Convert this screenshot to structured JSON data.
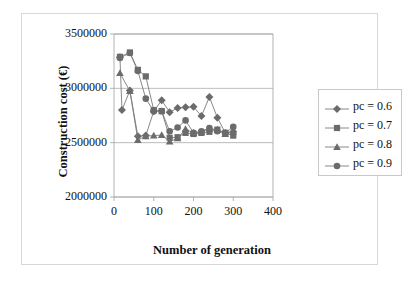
{
  "chart_data": {
    "type": "line",
    "title": "",
    "xlabel": "Number of generation",
    "ylabel": "Construction cost (€)",
    "xlim": [
      0,
      400
    ],
    "ylim": [
      2000000,
      3500000
    ],
    "xticks": [
      0,
      100,
      200,
      300,
      400
    ],
    "yticks": [
      2000000,
      2500000,
      3000000,
      3500000
    ],
    "xtick_labels": [
      "0",
      "100",
      "200",
      "300",
      "400"
    ],
    "ytick_labels": [
      "2000000",
      "2500000",
      "3000000",
      "3500000"
    ],
    "grid": "horizontal",
    "legend_position": "right-outside",
    "marker_color": "#6b6b6b",
    "line_color": "#7a7a7a",
    "axis_color": "#a9a9a9",
    "text_color": "#111111",
    "series": [
      {
        "name": "pc = 0.6",
        "marker": "diamond",
        "x": [
          15,
          20,
          40,
          60,
          80,
          100,
          120,
          140,
          160,
          180,
          200,
          220,
          240,
          260,
          280,
          300
        ],
        "values": [
          3285000,
          2800000,
          2980000,
          2560000,
          2565000,
          2790000,
          2890000,
          2780000,
          2820000,
          2825000,
          2830000,
          2745000,
          2920000,
          2730000,
          2590000,
          2600000
        ]
      },
      {
        "name": "pc = 0.7",
        "marker": "square",
        "x": [
          15,
          40,
          60,
          80,
          100,
          120,
          140,
          160,
          180,
          200,
          220,
          240,
          260,
          280,
          300
        ],
        "values": [
          3290000,
          3330000,
          3170000,
          3110000,
          2800000,
          2790000,
          2545000,
          2550000,
          2590000,
          2580000,
          2590000,
          2600000,
          2620000,
          2590000,
          2565000
        ]
      },
      {
        "name": "pc = 0.8",
        "marker": "triangle",
        "x": [
          15,
          40,
          60,
          80,
          100,
          120,
          140,
          160,
          180,
          200,
          220,
          240,
          260,
          280,
          300
        ],
        "values": [
          3140000,
          2975000,
          2525000,
          2560000,
          2565000,
          2570000,
          2510000,
          2540000,
          2625000,
          2590000,
          2600000,
          2630000,
          2620000,
          2580000,
          2600000
        ]
      },
      {
        "name": "pc = 0.9",
        "marker": "circle",
        "x": [
          15,
          40,
          60,
          80,
          100,
          120,
          140,
          160,
          180,
          200,
          220,
          240,
          260,
          280,
          300
        ],
        "values": [
          3280000,
          3325000,
          3160000,
          2905000,
          2790000,
          2790000,
          2605000,
          2640000,
          2705000,
          2590000,
          2605000,
          2635000,
          2605000,
          2590000,
          2645000
        ]
      }
    ]
  },
  "legend": {
    "entries": [
      {
        "label": "pc = 0.6",
        "marker": "diamond"
      },
      {
        "label": "pc = 0.7",
        "marker": "square"
      },
      {
        "label": "pc = 0.8",
        "marker": "triangle"
      },
      {
        "label": "pc = 0.9",
        "marker": "circle"
      }
    ]
  }
}
